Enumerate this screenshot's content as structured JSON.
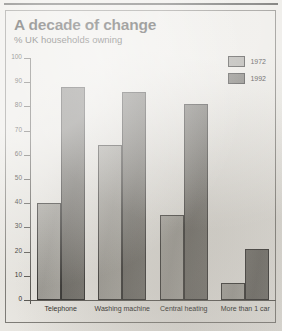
{
  "chart_data": {
    "type": "bar",
    "title": "A decade of change",
    "subtitle": "% UK households owning",
    "xlabel": "",
    "ylabel": "",
    "ylim": [
      0,
      100
    ],
    "yticks": [
      0,
      10,
      20,
      30,
      40,
      50,
      60,
      70,
      80,
      90,
      100
    ],
    "grid": false,
    "legend_position": "top-right",
    "categories": [
      "Telephone",
      "Washing machine",
      "Central heating",
      "More than 1 car"
    ],
    "series": [
      {
        "name": "1972",
        "color": "#a4a29c",
        "values": [
          40,
          64,
          35,
          7
        ]
      },
      {
        "name": "1992",
        "color": "#6d6b66",
        "values": [
          88,
          86,
          81,
          21
        ]
      }
    ]
  },
  "legend": {
    "items": [
      {
        "label": "1972"
      },
      {
        "label": "1992"
      }
    ]
  }
}
